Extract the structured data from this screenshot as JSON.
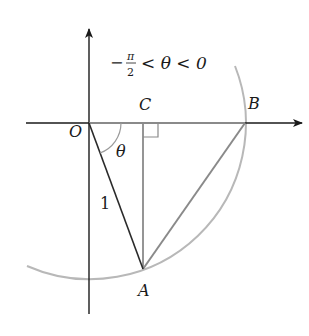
{
  "diagram": {
    "condition": {
      "minus": "−",
      "pi": "π",
      "two": "2",
      "rest": "< θ < 0"
    },
    "labels": {
      "origin": "O",
      "point_c": "C",
      "point_b": "B",
      "point_a": "A",
      "angle": "θ",
      "radius": "1"
    },
    "colors": {
      "axis": "#1a1a1a",
      "circle": "#b0b0b0",
      "gray_lines": "#8a8a8a",
      "radius_line": "#2a2a2a"
    }
  }
}
